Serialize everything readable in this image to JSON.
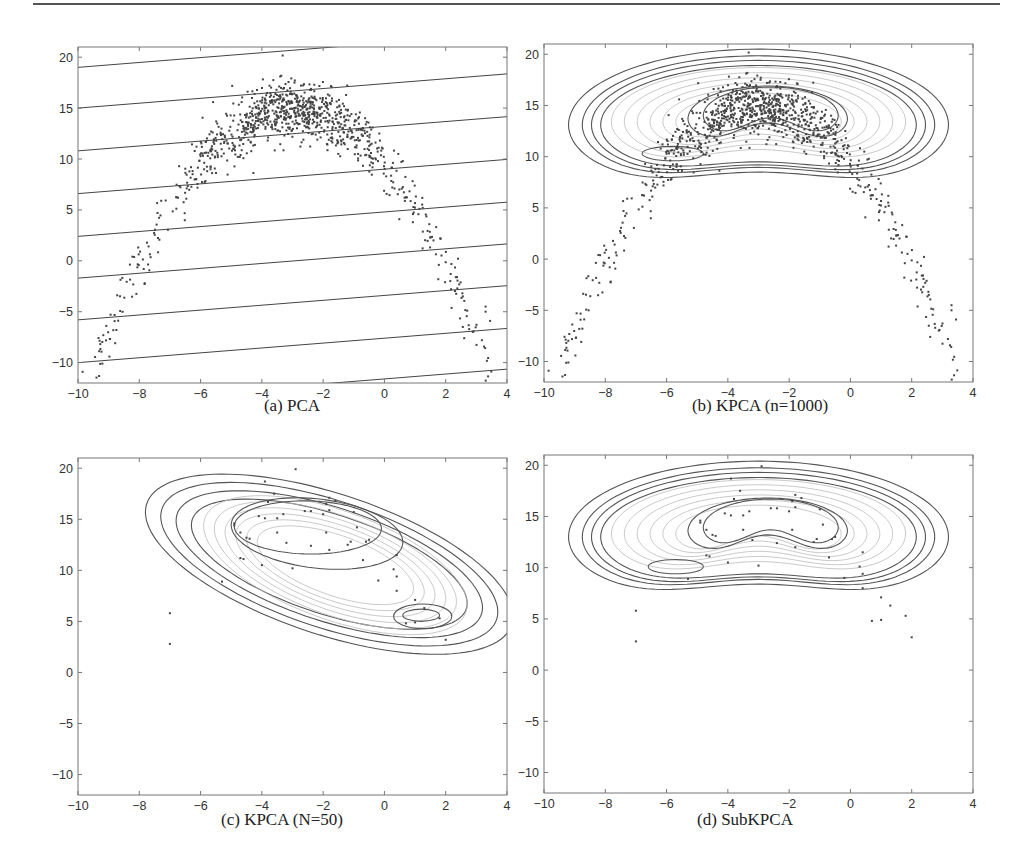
{
  "figure": {
    "panels": [
      {
        "id": "a",
        "caption": "(a)  PCA",
        "box": {
          "left": 78,
          "right": 507,
          "top": 47,
          "bottom": 383
        }
      },
      {
        "id": "b",
        "caption": "(b)  KPCA (n=1000)",
        "box": {
          "left": 544,
          "right": 973,
          "top": 44,
          "bottom": 382
        }
      },
      {
        "id": "c",
        "caption": "(c)  KPCA (N=50)",
        "box": {
          "left": 78,
          "right": 507,
          "top": 458,
          "bottom": 795
        }
      },
      {
        "id": "d",
        "caption": "(d)  SubKPCA",
        "box": {
          "left": 544,
          "right": 973,
          "top": 455,
          "bottom": 793
        }
      }
    ],
    "x_ticks": [
      "-10",
      "-8",
      "-6",
      "-4",
      "-2",
      "0",
      "2",
      "4"
    ],
    "y_ticks": [
      "20",
      "15",
      "10",
      "5",
      "0",
      "-5",
      "-10"
    ]
  },
  "chart_data": [
    {
      "type": "scatter",
      "title": "(a) PCA",
      "xlabel": "",
      "ylabel": "",
      "xlim": [
        -10,
        4
      ],
      "ylim": [
        -12,
        21
      ],
      "x_ticks": [
        -10,
        -8,
        -6,
        -4,
        -2,
        0,
        2,
        4
      ],
      "y_ticks": [
        -10,
        -5,
        0,
        5,
        10,
        15,
        20
      ],
      "grid": false,
      "description": "1000 points on a noisy parabolic arc peaking near (-3, 15); overlaid with parallel PCA contour lines (slope ~0.24)",
      "pca_lines_intercept_at_x_minus10": [
        19,
        15,
        10.8,
        6.6,
        2.4,
        -1.7,
        -5.8,
        -10,
        -14
      ],
      "pca_line_slope": 0.24
    },
    {
      "type": "scatter",
      "title": "(b) KPCA (n=1000)",
      "xlim": [
        -10,
        4
      ],
      "ylim": [
        -12,
        21
      ],
      "x_ticks": [
        -10,
        -8,
        -6,
        -4,
        -2,
        0,
        2,
        4
      ],
      "y_ticks": [
        -10,
        -5,
        0,
        5,
        10,
        15,
        20
      ],
      "description": "Same 1000 points with KPCA contour lines forming nested kidney-shaped rings centered near (-3, 12)"
    },
    {
      "type": "scatter",
      "title": "(c) KPCA (N=50)",
      "xlim": [
        -10,
        4
      ],
      "ylim": [
        -12,
        21
      ],
      "x_ticks": [
        -10,
        -8,
        -6,
        -4,
        -2,
        0,
        2,
        4
      ],
      "y_ticks": [
        -10,
        -5,
        0,
        5,
        10,
        15,
        20
      ],
      "description": "50 subsampled points with KPCA contours; inner blob near (-2.5, 14) and a secondary mode near (1.2, 5.5)"
    },
    {
      "type": "scatter",
      "title": "(d) SubKPCA",
      "xlim": [
        -10,
        4
      ],
      "ylim": [
        -12,
        21
      ],
      "x_ticks": [
        -10,
        -8,
        -6,
        -4,
        -2,
        0,
        2,
        4
      ],
      "y_ticks": [
        -10,
        -5,
        0,
        5,
        10,
        15,
        20
      ],
      "description": "50 points with SubKPCA contours; kidney-shaped rings similar to (b), small inner ellipse near (-5.7, 10)"
    }
  ],
  "subset_points": [
    [
      -2.9,
      19.9
    ],
    [
      -3.9,
      18.7
    ],
    [
      -3.6,
      17.5
    ],
    [
      -3.8,
      16.7
    ],
    [
      -1.8,
      17.1
    ],
    [
      -1.6,
      16.8
    ],
    [
      -1.9,
      16.5
    ],
    [
      -1.8,
      15.9
    ],
    [
      -4.1,
      15.3
    ],
    [
      -3.9,
      15.1
    ],
    [
      -3.5,
      15.1
    ],
    [
      -3.3,
      15.5
    ],
    [
      -2.6,
      15.8
    ],
    [
      -2.4,
      15.8
    ],
    [
      -2.0,
      15.5
    ],
    [
      -1.0,
      15.7
    ],
    [
      -4.9,
      14.6
    ],
    [
      -4.9,
      14.4
    ],
    [
      -4.7,
      13.7
    ],
    [
      -4.5,
      13.2
    ],
    [
      -4.4,
      13.1
    ],
    [
      -3.5,
      13.7
    ],
    [
      -1.9,
      13.7
    ],
    [
      -0.9,
      14.2
    ],
    [
      -3.2,
      12.7
    ],
    [
      -2.4,
      12.4
    ],
    [
      -1.8,
      12.0
    ],
    [
      -1.2,
      12.5
    ],
    [
      -1.1,
      12.8
    ],
    [
      -0.6,
      12.8
    ],
    [
      -0.5,
      13.0
    ],
    [
      -4.7,
      11.2
    ],
    [
      -4.6,
      11.1
    ],
    [
      -4.0,
      10.5
    ],
    [
      -3.0,
      10.2
    ],
    [
      -0.7,
      11.0
    ],
    [
      0.4,
      11.5
    ],
    [
      0.3,
      10.1
    ],
    [
      0.4,
      9.4
    ],
    [
      -0.2,
      9.0
    ],
    [
      -5.3,
      8.9
    ],
    [
      0.4,
      8.0
    ],
    [
      1.0,
      7.1
    ],
    [
      1.3,
      6.3
    ],
    [
      -7.0,
      5.8
    ],
    [
      0.7,
      4.8
    ],
    [
      1.0,
      4.9
    ],
    [
      1.8,
      5.3
    ],
    [
      -7.0,
      2.8
    ],
    [
      2.0,
      3.2
    ]
  ]
}
